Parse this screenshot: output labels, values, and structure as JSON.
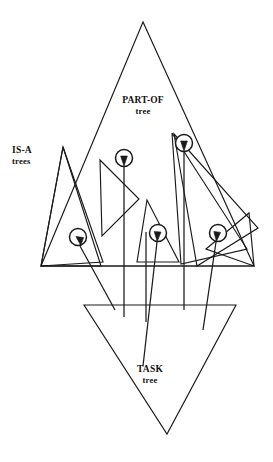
{
  "figure": {
    "kind": "concept-diagram",
    "background_color": "#ffffff",
    "line_color": "#1a1a1a"
  },
  "labels": {
    "part_of": {
      "line1": "PART-OF",
      "line2": "tree"
    },
    "is_a": {
      "line1": "IS-A",
      "line2": "trees"
    },
    "task": {
      "line1": "TASK",
      "line2": "tree"
    }
  },
  "structures": {
    "part_of_tree": {
      "name": "PART-OF tree",
      "shape": "triangle-apex-up",
      "points": "143,22 41,266 254,266"
    },
    "task_tree": {
      "name": "TASK tree",
      "shape": "triangle-apex-down",
      "points": "84,305 236,305 167,434"
    },
    "baseline": {
      "name": "part-of-baseline",
      "x1": 41,
      "y1": 266,
      "x2": 254,
      "y2": 266
    }
  },
  "is_a_trees": [
    {
      "id": "isa-1",
      "points": "41,266 101,266 63,147"
    },
    {
      "id": "isa-2",
      "points": "63,147 103,262 41,266"
    },
    {
      "id": "isa-3",
      "points": "100,160 102,236 139,199"
    },
    {
      "id": "isa-4",
      "points": "172,133 247,249 181,264"
    },
    {
      "id": "isa-5",
      "points": "174,134 258,228 197,266"
    },
    {
      "id": "isa-6",
      "points": "147,200 137,262 179,262"
    },
    {
      "id": "isa-7",
      "points": "206,249 249,213 254,266"
    }
  ],
  "nodes": [
    {
      "id": "node-a",
      "cx": 124,
      "cy": 158,
      "r": 8.5
    },
    {
      "id": "node-b",
      "cx": 184,
      "cy": 143,
      "r": 8.5
    },
    {
      "id": "node-c",
      "cx": 78,
      "cy": 237,
      "r": 8.5
    },
    {
      "id": "node-d",
      "cx": 158,
      "cy": 233,
      "r": 8.5
    },
    {
      "id": "node-e",
      "cx": 218,
      "cy": 233,
      "r": 8.5
    }
  ],
  "links": [
    {
      "id": "link-a",
      "from_node": "node-a",
      "d": "M124,317 L124,167"
    },
    {
      "id": "link-b",
      "from_node": "node-b",
      "d": "M184,310 L184,152"
    },
    {
      "id": "link-c",
      "from_node": "node-c",
      "d": "M115,310 L80,246"
    },
    {
      "id": "link-d",
      "from_node": "node-d",
      "d": "M143,366 L157,242"
    },
    {
      "id": "link-e",
      "from_node": "node-e",
      "d": "M203,330 L216,242"
    },
    {
      "id": "link-f",
      "from_node": null,
      "d": "M146,322 L146,232"
    }
  ],
  "arrowheads": [
    {
      "id": "arrow-a",
      "points": "124,166 120.6,156 127.4,156"
    },
    {
      "id": "arrow-b",
      "points": "184,151 180.6,141 187.4,141"
    },
    {
      "id": "arrow-c",
      "points": "80.8,245.4 75.9,236.4 83.6,237.6"
    },
    {
      "id": "arrow-d",
      "points": "157.2,241.6 154.2,231.5 161,232.1"
    },
    {
      "id": "arrow-e",
      "points": "216.4,241.6 213.8,231.4 220.6,232.4"
    }
  ],
  "label_positions": {
    "part_of": {
      "x": 143,
      "y": 103,
      "x2": 143,
      "y2": 114
    },
    "is_a": {
      "x": 12,
      "y": 153,
      "x2": 12,
      "y2": 164
    },
    "task": {
      "x": 150,
      "y": 372,
      "x2": 150,
      "y2": 383
    }
  }
}
